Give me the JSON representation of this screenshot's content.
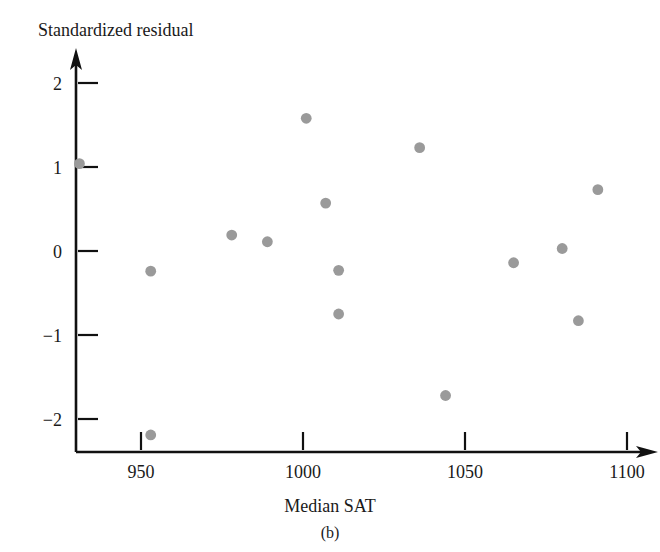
{
  "figure": {
    "caption": "(b)",
    "point_color": "#9a9a9a",
    "axis_color": "#111111"
  },
  "chart_data": {
    "type": "scatter",
    "title": "",
    "xlabel": "Median SAT",
    "ylabel": "Standardized residual",
    "xlim": [
      920,
      1105
    ],
    "ylim": [
      -2.45,
      2.3
    ],
    "grid": false,
    "legend": null,
    "xticks": [
      950,
      1000,
      1050,
      1100
    ],
    "xtick_labels": [
      "950",
      "1000",
      "1050",
      "1100"
    ],
    "yticks": [
      2,
      1,
      0,
      -1,
      -2
    ],
    "ytick_labels": [
      "2",
      "1",
      "0",
      "−1",
      "−2"
    ],
    "x": [
      931,
      953,
      953,
      978,
      989,
      1001,
      1007,
      1011,
      1011,
      1036,
      1044,
      1065,
      1080,
      1085,
      1091
    ],
    "y": [
      1.04,
      -0.24,
      -2.19,
      0.19,
      0.11,
      1.58,
      0.57,
      -0.23,
      -0.75,
      1.23,
      -1.72,
      -0.14,
      0.03,
      -0.83,
      0.73
    ],
    "points": [
      {
        "x": 931,
        "y": 1.04
      },
      {
        "x": 953,
        "y": -0.24
      },
      {
        "x": 953,
        "y": -2.19
      },
      {
        "x": 978,
        "y": 0.19
      },
      {
        "x": 989,
        "y": 0.11
      },
      {
        "x": 1001,
        "y": 1.58
      },
      {
        "x": 1007,
        "y": 0.57
      },
      {
        "x": 1011,
        "y": -0.23
      },
      {
        "x": 1011,
        "y": -0.75
      },
      {
        "x": 1036,
        "y": 1.23
      },
      {
        "x": 1044,
        "y": -1.72
      },
      {
        "x": 1065,
        "y": -0.14
      },
      {
        "x": 1080,
        "y": 0.03
      },
      {
        "x": 1085,
        "y": -0.83
      },
      {
        "x": 1091,
        "y": 0.73
      }
    ]
  }
}
